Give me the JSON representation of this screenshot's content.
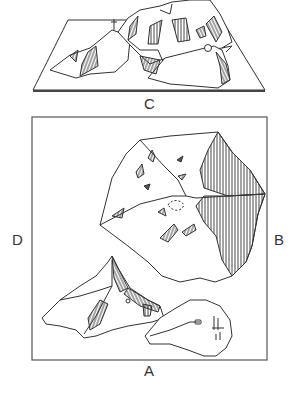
{
  "figure": {
    "labels": {
      "top_model": "C",
      "left": "D",
      "right": "B",
      "bottom": "A"
    },
    "caption_cropped": "",
    "colors": {
      "ink": "#333333",
      "frame": "#555555",
      "background": "#ffffff",
      "caption": "#c8c8c8"
    }
  }
}
